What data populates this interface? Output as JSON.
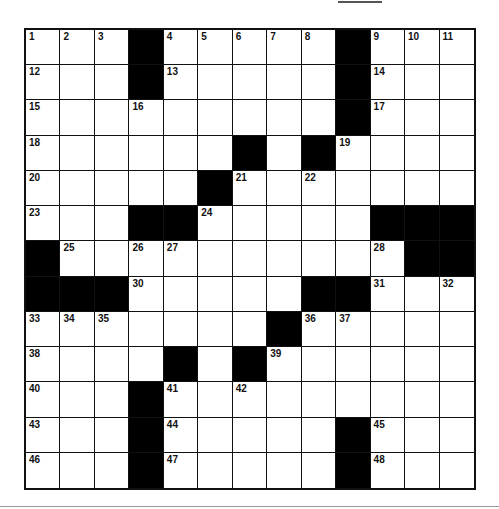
{
  "puzzle": {
    "rows": 13,
    "cols": 13,
    "layout": [
      "...#.....#...",
      "...#.....#...",
      ".........#...",
      "......#.#....",
      ".....#.......",
      "...##.....###",
      "#..........##",
      "###.....##...",
      ".......#.....",
      "....#.#......",
      "...#.........",
      "...#.....#...",
      "...#.....#..."
    ],
    "numbers": [
      {
        "r": 0,
        "c": 0,
        "n": "1"
      },
      {
        "r": 0,
        "c": 1,
        "n": "2"
      },
      {
        "r": 0,
        "c": 2,
        "n": "3"
      },
      {
        "r": 0,
        "c": 4,
        "n": "4"
      },
      {
        "r": 0,
        "c": 5,
        "n": "5"
      },
      {
        "r": 0,
        "c": 6,
        "n": "6"
      },
      {
        "r": 0,
        "c": 7,
        "n": "7"
      },
      {
        "r": 0,
        "c": 8,
        "n": "8"
      },
      {
        "r": 0,
        "c": 10,
        "n": "9"
      },
      {
        "r": 0,
        "c": 11,
        "n": "10"
      },
      {
        "r": 0,
        "c": 12,
        "n": "11"
      },
      {
        "r": 1,
        "c": 0,
        "n": "12"
      },
      {
        "r": 1,
        "c": 4,
        "n": "13"
      },
      {
        "r": 1,
        "c": 10,
        "n": "14"
      },
      {
        "r": 2,
        "c": 0,
        "n": "15"
      },
      {
        "r": 2,
        "c": 3,
        "n": "16"
      },
      {
        "r": 2,
        "c": 10,
        "n": "17"
      },
      {
        "r": 3,
        "c": 0,
        "n": "18"
      },
      {
        "r": 3,
        "c": 9,
        "n": "19"
      },
      {
        "r": 4,
        "c": 0,
        "n": "20"
      },
      {
        "r": 4,
        "c": 6,
        "n": "21"
      },
      {
        "r": 4,
        "c": 8,
        "n": "22"
      },
      {
        "r": 5,
        "c": 0,
        "n": "23"
      },
      {
        "r": 5,
        "c": 5,
        "n": "24"
      },
      {
        "r": 6,
        "c": 1,
        "n": "25"
      },
      {
        "r": 6,
        "c": 3,
        "n": "26"
      },
      {
        "r": 6,
        "c": 4,
        "n": "27"
      },
      {
        "r": 6,
        "c": 10,
        "n": "28"
      },
      {
        "r": 6,
        "c": 11,
        "n": "29"
      },
      {
        "r": 7,
        "c": 3,
        "n": "30"
      },
      {
        "r": 7,
        "c": 10,
        "n": "31"
      },
      {
        "r": 7,
        "c": 12,
        "n": "32"
      },
      {
        "r": 8,
        "c": 0,
        "n": "33"
      },
      {
        "r": 8,
        "c": 1,
        "n": "34"
      },
      {
        "r": 8,
        "c": 2,
        "n": "35"
      },
      {
        "r": 8,
        "c": 8,
        "n": "36"
      },
      {
        "r": 8,
        "c": 9,
        "n": "37"
      },
      {
        "r": 9,
        "c": 0,
        "n": "38"
      },
      {
        "r": 9,
        "c": 7,
        "n": "39"
      },
      {
        "r": 10,
        "c": 0,
        "n": "40"
      },
      {
        "r": 10,
        "c": 4,
        "n": "41"
      },
      {
        "r": 10,
        "c": 6,
        "n": "42"
      },
      {
        "r": 11,
        "c": 0,
        "n": "43"
      },
      {
        "r": 11,
        "c": 4,
        "n": "44"
      },
      {
        "r": 11,
        "c": 10,
        "n": "45"
      },
      {
        "r": 12,
        "c": 0,
        "n": "46"
      },
      {
        "r": 12,
        "c": 4,
        "n": "47"
      },
      {
        "r": 12,
        "c": 10,
        "n": "48"
      }
    ],
    "colors": {
      "block": "#000000",
      "cell": "#ffffff",
      "line": "#111111"
    }
  }
}
